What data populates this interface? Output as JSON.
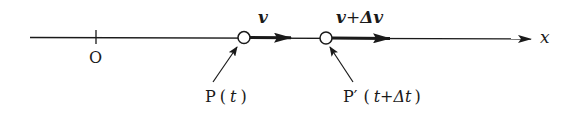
{
  "diagram": {
    "axis_label": "x",
    "origin_label": "O",
    "velocity_label": "v",
    "velocity_label2_a": "v",
    "velocity_label2_plus": "+",
    "velocity_label2_b": "Δv",
    "point1": {
      "name": "P",
      "open": "(",
      "t": "t",
      "close": ")"
    },
    "point2": {
      "name": "P′",
      "open": "(",
      "t": "t",
      "plus": "+",
      "dt": "Δt",
      "close": ")"
    },
    "colors": {
      "ink": "#1a1a1a",
      "background": "#ffffff"
    }
  }
}
